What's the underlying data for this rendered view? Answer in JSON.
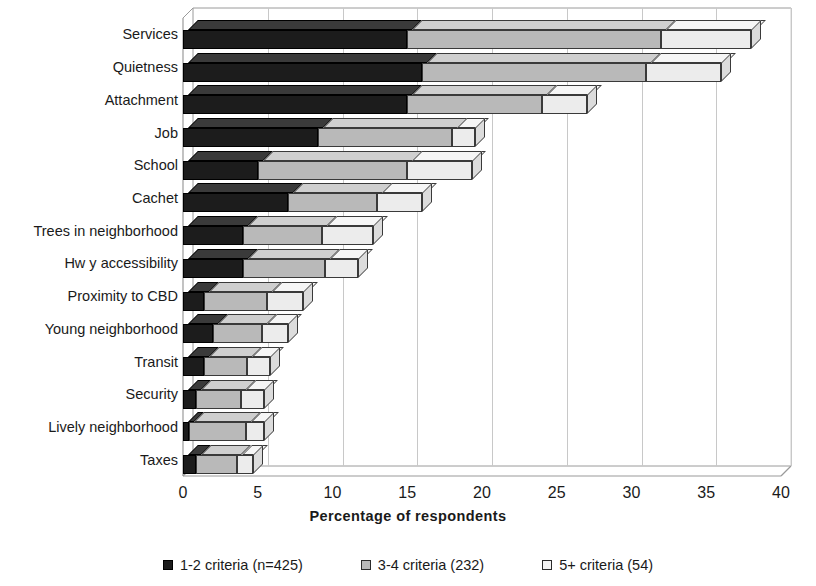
{
  "chart_data": {
    "type": "bar",
    "orientation": "horizontal",
    "stacked": true,
    "three_d": true,
    "title": "",
    "xlabel": "Percentage of respondents",
    "ylabel": "",
    "xlim": [
      0,
      40
    ],
    "xticks": [
      0,
      5,
      10,
      15,
      20,
      25,
      30,
      35,
      40
    ],
    "grid": true,
    "legend_position": "bottom",
    "categories": [
      "Taxes",
      "Lively neighborhood",
      "Security",
      "Transit",
      "Young neighborhood",
      "Proximity to CBD",
      "Hw y accessibility",
      "Trees in neighborhood",
      "Cachet",
      "School",
      "Job",
      "Attachment",
      "Quietness",
      "Services"
    ],
    "series": [
      {
        "name": "1-2 criteria (n=425)",
        "color": "#1c1c1c",
        "values": [
          0.9,
          0.4,
          0.9,
          1.4,
          2.0,
          1.4,
          4.0,
          4.0,
          7.0,
          5.0,
          9.0,
          15.0,
          16.0,
          15.0
        ]
      },
      {
        "name": "3-4 criteria (232)",
        "color": "#b9b9b9",
        "values": [
          2.7,
          3.8,
          3.0,
          2.9,
          3.3,
          4.2,
          5.5,
          5.3,
          6.0,
          10.0,
          9.0,
          9.0,
          15.0,
          17.0
        ]
      },
      {
        "name": "5+ criteria (54)",
        "color": "#ececec",
        "values": [
          1.1,
          1.2,
          1.5,
          1.5,
          1.7,
          2.4,
          2.2,
          3.4,
          3.0,
          4.3,
          1.5,
          3.0,
          5.0,
          6.0
        ]
      }
    ],
    "totals": [
      4.7,
      5.4,
      5.4,
      5.8,
      7.0,
      8.0,
      11.7,
      12.7,
      16.0,
      19.3,
      19.5,
      27.0,
      36.0,
      38.0
    ]
  },
  "legend": {
    "items": [
      {
        "label": "1-2 criteria (n=425)",
        "swatch": "s1"
      },
      {
        "label": "3-4 criteria (232)",
        "swatch": "s2"
      },
      {
        "label": "5+ criteria (54)",
        "swatch": "s3"
      }
    ]
  },
  "axis": {
    "x_title": "Percentage of respondents"
  }
}
